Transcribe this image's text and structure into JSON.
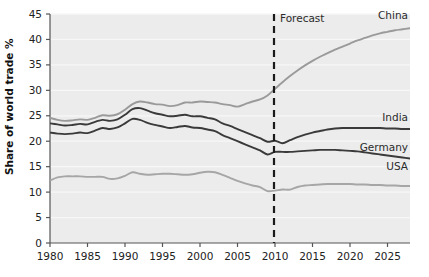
{
  "chart_data": {
    "type": "line",
    "title": "",
    "xlabel": "",
    "ylabel": "Share of world trade %",
    "xlim": [
      1980,
      2028
    ],
    "ylim": [
      0,
      45
    ],
    "grid": true,
    "legend_position": "inline-right-of-line-end",
    "xticks": [
      "1980",
      "1985",
      "1990",
      "1995",
      "2000",
      "2005",
      "2010",
      "2015",
      "2020",
      "2025"
    ],
    "xtick_values": [
      1980,
      1985,
      1990,
      1995,
      2000,
      2005,
      2010,
      2015,
      2020,
      2025
    ],
    "yticks": [
      "0",
      "5",
      "10",
      "15",
      "20",
      "25",
      "30",
      "35",
      "40",
      "45"
    ],
    "ytick_values": [
      0,
      5,
      10,
      15,
      20,
      25,
      30,
      35,
      40,
      45
    ],
    "annotations": [
      {
        "name": "forecast-divider",
        "label": "Forecast",
        "x": 2010,
        "style": "dashed-vertical"
      }
    ],
    "series": [
      {
        "name": "China",
        "label": "China",
        "color": "#9a9a9a",
        "x": [
          1980,
          1981,
          1982,
          1983,
          1984,
          1985,
          1986,
          1987,
          1988,
          1989,
          1990,
          1991,
          1992,
          1993,
          1994,
          1995,
          1996,
          1997,
          1998,
          1999,
          2000,
          2001,
          2002,
          2003,
          2004,
          2005,
          2006,
          2007,
          2008,
          2009,
          2010,
          2011,
          2012,
          2013,
          2014,
          2015,
          2016,
          2017,
          2018,
          2019,
          2020,
          2021,
          2022,
          2023,
          2024,
          2025,
          2026,
          2027,
          2028
        ],
        "values": [
          24.6,
          24.2,
          24.0,
          24.1,
          24.3,
          24.2,
          24.6,
          25.1,
          25.0,
          25.3,
          26.2,
          27.3,
          27.8,
          27.6,
          27.3,
          27.2,
          26.9,
          27.1,
          27.6,
          27.6,
          27.8,
          27.7,
          27.6,
          27.3,
          27.1,
          26.8,
          27.3,
          27.8,
          28.2,
          29.0,
          30.3,
          31.6,
          32.8,
          33.9,
          34.9,
          35.8,
          36.6,
          37.3,
          38.0,
          38.6,
          39.2,
          39.8,
          40.3,
          40.8,
          41.2,
          41.5,
          41.8,
          42.0,
          42.2
        ]
      },
      {
        "name": "India",
        "label": "India",
        "color": "#3a3a3a",
        "x": [
          1980,
          1981,
          1982,
          1983,
          1984,
          1985,
          1986,
          1987,
          1988,
          1989,
          1990,
          1991,
          1992,
          1993,
          1994,
          1995,
          1996,
          1997,
          1998,
          1999,
          2000,
          2001,
          2002,
          2003,
          2004,
          2005,
          2006,
          2007,
          2008,
          2009,
          2010,
          2011,
          2012,
          2013,
          2014,
          2015,
          2016,
          2017,
          2018,
          2019,
          2020,
          2021,
          2022,
          2023,
          2024,
          2025,
          2026,
          2027,
          2028
        ],
        "values": [
          23.5,
          23.3,
          23.1,
          23.2,
          23.4,
          23.3,
          23.8,
          24.2,
          24.0,
          24.3,
          25.2,
          26.3,
          26.5,
          26.0,
          25.5,
          25.2,
          24.9,
          25.0,
          25.2,
          24.9,
          24.9,
          24.6,
          24.3,
          23.5,
          23.0,
          22.4,
          21.8,
          21.2,
          20.6,
          19.9,
          20.1,
          19.6,
          20.2,
          20.8,
          21.3,
          21.7,
          22.0,
          22.3,
          22.5,
          22.6,
          22.6,
          22.6,
          22.6,
          22.6,
          22.6,
          22.5,
          22.5,
          22.4,
          22.4
        ]
      },
      {
        "name": "Germany",
        "label": "Germany",
        "color": "#3a3a3a",
        "x": [
          1980,
          1981,
          1982,
          1983,
          1984,
          1985,
          1986,
          1987,
          1988,
          1989,
          1990,
          1991,
          1992,
          1993,
          1994,
          1995,
          1996,
          1997,
          1998,
          1999,
          2000,
          2001,
          2002,
          2003,
          2004,
          2005,
          2006,
          2007,
          2008,
          2009,
          2010,
          2011,
          2012,
          2013,
          2014,
          2015,
          2016,
          2017,
          2018,
          2019,
          2020,
          2021,
          2022,
          2023,
          2024,
          2025,
          2026,
          2027,
          2028
        ],
        "values": [
          21.7,
          21.5,
          21.4,
          21.5,
          21.7,
          21.6,
          22.1,
          22.6,
          22.4,
          22.7,
          23.5,
          24.4,
          24.2,
          23.6,
          23.2,
          22.9,
          22.6,
          22.8,
          23.0,
          22.7,
          22.6,
          22.3,
          22.0,
          21.2,
          20.6,
          20.0,
          19.4,
          18.8,
          18.2,
          17.4,
          17.9,
          17.9,
          17.9,
          18.0,
          18.1,
          18.2,
          18.3,
          18.3,
          18.3,
          18.2,
          18.1,
          18.0,
          17.8,
          17.6,
          17.4,
          17.2,
          17.0,
          16.8,
          16.6
        ]
      },
      {
        "name": "USA",
        "label": "USA",
        "color": "#a6a6a6",
        "x": [
          1980,
          1981,
          1982,
          1983,
          1984,
          1985,
          1986,
          1987,
          1988,
          1989,
          1990,
          1991,
          1992,
          1993,
          1994,
          1995,
          1996,
          1997,
          1998,
          1999,
          2000,
          2001,
          2002,
          2003,
          2004,
          2005,
          2006,
          2007,
          2008,
          2009,
          2010,
          2011,
          2012,
          2013,
          2014,
          2015,
          2016,
          2017,
          2018,
          2019,
          2020,
          2021,
          2022,
          2023,
          2024,
          2025,
          2026,
          2027,
          2028
        ],
        "values": [
          12.3,
          12.9,
          13.1,
          13.1,
          13.1,
          13.0,
          13.0,
          13.0,
          12.6,
          12.7,
          13.2,
          13.9,
          13.6,
          13.4,
          13.5,
          13.6,
          13.6,
          13.5,
          13.4,
          13.5,
          13.8,
          14.0,
          13.9,
          13.4,
          12.8,
          12.2,
          11.7,
          11.3,
          11.0,
          10.2,
          10.3,
          10.5,
          10.5,
          11.0,
          11.3,
          11.4,
          11.5,
          11.6,
          11.6,
          11.6,
          11.6,
          11.5,
          11.5,
          11.4,
          11.4,
          11.3,
          11.3,
          11.2,
          11.2
        ]
      }
    ]
  },
  "style": {
    "plot_bg": "#ececec",
    "gridline_color": "#f7f7f7",
    "axis_color": "#555555",
    "forecast_line_color": "#1a1a1a"
  }
}
